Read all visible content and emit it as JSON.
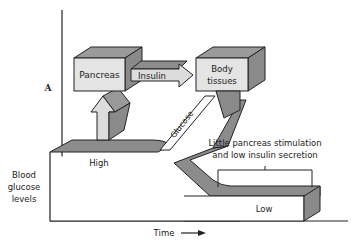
{
  "panel_label": "A",
  "axes": {
    "y_label_lines": [
      "Blood",
      "glucose",
      "levels"
    ],
    "x_label": "Time"
  },
  "boxes": {
    "pancreas": "Pancreas",
    "body_tissues_lines": [
      "Body",
      "tissues"
    ]
  },
  "arrows": {
    "insulin": "Insulin",
    "glucose": "Glucose"
  },
  "levels": {
    "high": "High",
    "low": "Low"
  },
  "annotation_lines": [
    "Little pancreas stimulation",
    "and low insulin secretion"
  ],
  "colors": {
    "box_front": "#e4e4e4",
    "box_top": "#9a9a9a",
    "box_side": "#8a8a8a",
    "arrow_light": "#dcdcdc",
    "band": "#8c8c8c",
    "stroke": "#222222"
  }
}
